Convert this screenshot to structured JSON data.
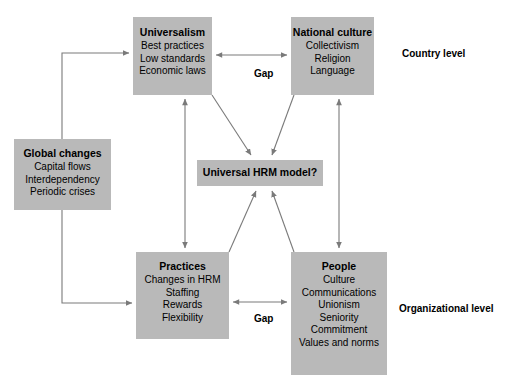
{
  "diagram": {
    "background_color": "#ffffff",
    "box_fill_color": "#b9b9b9",
    "line_color": "#7a7a7a",
    "text_color": "#000000",
    "boxes": {
      "universalism": {
        "title": "Universalism",
        "items": [
          "Best practices",
          "Low standards",
          "Economic laws"
        ]
      },
      "national_culture": {
        "title": "National culture",
        "items": [
          "Collectivism",
          "Religion",
          "Language"
        ]
      },
      "global_changes": {
        "title": "Global changes",
        "items": [
          "Capital flows",
          "Interdependency",
          "Periodic crises"
        ]
      },
      "universal_hrm": {
        "title": "Universal HRM model?",
        "items": []
      },
      "practices": {
        "title": "Practices",
        "items": [
          "Changes in HRM",
          "Staffing",
          "Rewards",
          "Flexibility"
        ]
      },
      "people": {
        "title": "People",
        "items": [
          "Culture",
          "Communications",
          "Unionism",
          "Seniority",
          "Commitment",
          "Values and norms"
        ]
      }
    },
    "labels": {
      "country_level": "Country level",
      "organizational_level": "Organizational level",
      "gap_top": "Gap",
      "gap_bottom": "Gap"
    },
    "connectors": [
      {
        "name": "global-changes-to-universalism",
        "from": "global_changes",
        "to": "universalism",
        "style": "elbow",
        "heads": "single"
      },
      {
        "name": "global-changes-to-practices",
        "from": "global_changes",
        "to": "practices",
        "style": "elbow",
        "heads": "single"
      },
      {
        "name": "universalism-to-national-culture-gap",
        "from": "universalism",
        "to": "national_culture",
        "style": "straight",
        "heads": "double",
        "label": "Gap"
      },
      {
        "name": "practices-to-people-gap",
        "from": "practices",
        "to": "people",
        "style": "straight",
        "heads": "double",
        "label": "Gap"
      },
      {
        "name": "universalism-to-practices",
        "from": "universalism",
        "to": "practices",
        "style": "straight",
        "heads": "double"
      },
      {
        "name": "national-culture-to-people",
        "from": "national_culture",
        "to": "people",
        "style": "straight",
        "heads": "double"
      },
      {
        "name": "universalism-to-universal-hrm",
        "from": "universalism",
        "to": "universal_hrm",
        "style": "diagonal",
        "heads": "single"
      },
      {
        "name": "national-culture-to-universal-hrm",
        "from": "national_culture",
        "to": "universal_hrm",
        "style": "diagonal",
        "heads": "single"
      },
      {
        "name": "practices-to-universal-hrm",
        "from": "practices",
        "to": "universal_hrm",
        "style": "diagonal",
        "heads": "single"
      },
      {
        "name": "people-to-universal-hrm",
        "from": "people",
        "to": "universal_hrm",
        "style": "diagonal",
        "heads": "single"
      }
    ]
  }
}
